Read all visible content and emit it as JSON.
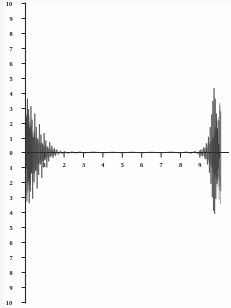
{
  "chart_data": {
    "type": "line",
    "title": "",
    "subtitle": "",
    "xlabel": "",
    "ylabel": "",
    "xlim": [
      0,
      10.2
    ],
    "ylim": [
      -10,
      10
    ],
    "grid": false,
    "legend": null,
    "x_ticks": [
      0,
      1,
      2,
      3,
      4,
      5,
      6,
      7,
      8,
      9,
      10
    ],
    "x_tick_labels": [
      "",
      "1",
      "2",
      "3",
      "4",
      "5",
      "6",
      "7",
      "8",
      "9",
      ""
    ],
    "y_ticks": [
      10,
      9,
      8,
      7,
      6,
      5,
      4,
      3,
      2,
      1,
      0,
      -1,
      -2,
      -3,
      -4,
      -5,
      -6,
      -7,
      -8,
      -9,
      -10
    ],
    "y_tick_labels": [
      "10",
      "9",
      "8",
      "7",
      "6",
      "5",
      "4",
      "3",
      "2",
      "1",
      "0",
      "1",
      "2",
      "3",
      "4",
      "5",
      "6",
      "7",
      "8",
      "9",
      "10"
    ],
    "series": [
      {
        "name": "signal",
        "color": "#3a3a36",
        "description": "Near-zero baseline across the interior with large damped transient oscillations at both ends of the record",
        "points": [
          [
            0.0,
            0.0
          ],
          [
            0.04,
            2.4
          ],
          [
            0.07,
            -1.1
          ],
          [
            0.1,
            3.6
          ],
          [
            0.13,
            -2.0
          ],
          [
            0.16,
            2.9
          ],
          [
            0.19,
            -3.4
          ],
          [
            0.22,
            1.6
          ],
          [
            0.25,
            -2.6
          ],
          [
            0.28,
            3.1
          ],
          [
            0.31,
            -1.4
          ],
          [
            0.34,
            2.2
          ],
          [
            0.37,
            -3.1
          ],
          [
            0.4,
            1.0
          ],
          [
            0.44,
            -2.0
          ],
          [
            0.48,
            2.6
          ],
          [
            0.52,
            -1.2
          ],
          [
            0.56,
            1.7
          ],
          [
            0.6,
            -2.4
          ],
          [
            0.64,
            0.9
          ],
          [
            0.68,
            -1.5
          ],
          [
            0.72,
            1.9
          ],
          [
            0.76,
            -0.8
          ],
          [
            0.8,
            1.2
          ],
          [
            0.84,
            -1.7
          ],
          [
            0.88,
            0.6
          ],
          [
            0.92,
            -1.0
          ],
          [
            0.96,
            1.3
          ],
          [
            1.0,
            -0.5
          ],
          [
            1.05,
            0.8
          ],
          [
            1.1,
            -1.0
          ],
          [
            1.15,
            0.4
          ],
          [
            1.2,
            -0.6
          ],
          [
            1.25,
            0.7
          ],
          [
            1.3,
            -0.3
          ],
          [
            1.36,
            0.45
          ],
          [
            1.42,
            -0.35
          ],
          [
            1.48,
            0.3
          ],
          [
            1.55,
            -0.22
          ],
          [
            1.62,
            0.2
          ],
          [
            1.7,
            -0.15
          ],
          [
            1.8,
            0.12
          ],
          [
            1.9,
            -0.1
          ],
          [
            2.0,
            0.08
          ],
          [
            2.2,
            -0.06
          ],
          [
            2.4,
            0.05
          ],
          [
            2.6,
            -0.04
          ],
          [
            2.8,
            0.04
          ],
          [
            3.0,
            -0.03
          ],
          [
            3.5,
            0.03
          ],
          [
            4.0,
            -0.02
          ],
          [
            4.5,
            0.02
          ],
          [
            5.0,
            -0.02
          ],
          [
            5.5,
            0.02
          ],
          [
            6.0,
            -0.02
          ],
          [
            6.5,
            0.02
          ],
          [
            7.0,
            -0.02
          ],
          [
            7.5,
            0.03
          ],
          [
            8.0,
            -0.03
          ],
          [
            8.3,
            0.04
          ],
          [
            8.55,
            -0.06
          ],
          [
            8.75,
            0.09
          ],
          [
            8.9,
            -0.12
          ],
          [
            9.02,
            0.18
          ],
          [
            9.12,
            -0.25
          ],
          [
            9.2,
            0.34
          ],
          [
            9.27,
            -0.45
          ],
          [
            9.33,
            0.62
          ],
          [
            9.39,
            -0.8
          ],
          [
            9.44,
            1.05
          ],
          [
            9.49,
            -1.35
          ],
          [
            9.53,
            1.7
          ],
          [
            9.57,
            -2.1
          ],
          [
            9.61,
            2.55
          ],
          [
            9.64,
            -3.0
          ],
          [
            9.67,
            3.45
          ],
          [
            9.7,
            -3.9
          ],
          [
            9.73,
            4.3
          ],
          [
            9.76,
            -4.1
          ],
          [
            9.79,
            3.6
          ],
          [
            9.82,
            -3.1
          ],
          [
            9.85,
            2.6
          ],
          [
            9.88,
            -2.1
          ],
          [
            9.91,
            1.6
          ],
          [
            9.94,
            -1.1
          ],
          [
            9.97,
            0.6
          ],
          [
            10.0,
            0.0
          ]
        ]
      }
    ],
    "annotations": [
      {
        "name": "left-transient",
        "x_range": [
          0.0,
          1.6
        ],
        "peak_amplitude": 3.6,
        "trough_amplitude": -3.9
      },
      {
        "name": "right-transient",
        "x_range": [
          9.0,
          10.1
        ],
        "peak_amplitude": 4.3,
        "trough_amplitude": -4.4
      },
      {
        "name": "zero-baseline",
        "x_range": [
          2.0,
          8.5
        ],
        "amplitude": 0.0
      }
    ]
  },
  "figure": {
    "axis_color": "#2b2b28",
    "trace_color": "#3a3a36",
    "background_color": "#fdfdfc",
    "y_axis_label_note": "negative half labelled without minus signs",
    "x_axis_note": "ticks at integer units, baseline drawn at y=0"
  }
}
